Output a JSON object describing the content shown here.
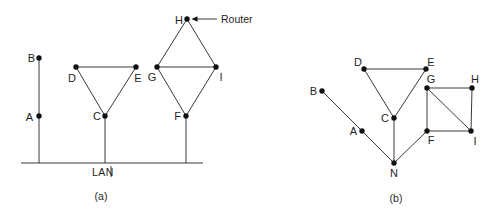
{
  "figure": {
    "width": 499,
    "height": 216,
    "colors": {
      "background": "#ffffff",
      "line": "#3a3a3a",
      "node_fill": "#111111",
      "text": "#1f1f1f"
    },
    "node_radius": 2.7,
    "captions": {
      "a": "(a)",
      "b": "(b)"
    },
    "labels": {
      "lan": "LAN",
      "router": "Router"
    },
    "diagram_a": {
      "nodes": [
        {
          "id": "B",
          "x": 39,
          "y": 58,
          "label": "B",
          "lx": 35,
          "ly": 62,
          "anchor": "end"
        },
        {
          "id": "A",
          "x": 39,
          "y": 116,
          "label": "A",
          "lx": 33,
          "ly": 121,
          "anchor": "end"
        },
        {
          "id": "D",
          "x": 76,
          "y": 67,
          "label": "D",
          "lx": 72,
          "ly": 82,
          "anchor": "middle"
        },
        {
          "id": "E",
          "x": 136,
          "y": 67,
          "label": "E",
          "lx": 138,
          "ly": 82,
          "anchor": "middle"
        },
        {
          "id": "C",
          "x": 105,
          "y": 116,
          "label": "C",
          "lx": 101,
          "ly": 120,
          "anchor": "end"
        },
        {
          "id": "H",
          "x": 187,
          "y": 19,
          "label": "H",
          "lx": 183,
          "ly": 24,
          "anchor": "end"
        },
        {
          "id": "G",
          "x": 157,
          "y": 67,
          "label": "G",
          "lx": 152,
          "ly": 81,
          "anchor": "middle"
        },
        {
          "id": "I",
          "x": 216,
          "y": 67,
          "label": "I",
          "lx": 221,
          "ly": 81,
          "anchor": "middle"
        },
        {
          "id": "F",
          "x": 186,
          "y": 116,
          "label": "F",
          "lx": 181,
          "ly": 120,
          "anchor": "end"
        }
      ],
      "edges": [
        [
          "D",
          "E"
        ],
        [
          "D",
          "C"
        ],
        [
          "E",
          "C"
        ],
        [
          "H",
          "G"
        ],
        [
          "H",
          "I"
        ],
        [
          "G",
          "I"
        ],
        [
          "G",
          "F"
        ],
        [
          "I",
          "F"
        ]
      ],
      "bus": {
        "x1": 21,
        "y1": 163,
        "x2": 203,
        "y2": 163
      },
      "drops": [
        {
          "x": 39,
          "y1": 58,
          "y2": 163
        },
        {
          "x": 105,
          "y1": 116,
          "y2": 163
        },
        {
          "x": 186,
          "y1": 116,
          "y2": 163
        }
      ],
      "lan_label_tick": {
        "x": 111,
        "y1": 166,
        "y2": 177
      },
      "router_arrow": {
        "line": {
          "x1": 217,
          "y1": 19,
          "x2": 197,
          "y2": 19
        },
        "head": {
          "tip_x": 191.5,
          "tip_y": 19,
          "back_x": 197.5,
          "half_h": 2.7
        }
      }
    },
    "diagram_b": {
      "nodes": [
        {
          "id": "B",
          "x": 322,
          "y": 91,
          "label": "B",
          "lx": 317,
          "ly": 95,
          "anchor": "end"
        },
        {
          "id": "A",
          "x": 362,
          "y": 131,
          "label": "A",
          "lx": 357,
          "ly": 135,
          "anchor": "end"
        },
        {
          "id": "N",
          "x": 394,
          "y": 163,
          "label": "N",
          "lx": 394,
          "ly": 177,
          "anchor": "middle"
        },
        {
          "id": "C",
          "x": 394,
          "y": 118,
          "label": "C",
          "lx": 389,
          "ly": 122,
          "anchor": "end"
        },
        {
          "id": "D",
          "x": 364,
          "y": 69,
          "label": "D",
          "lx": 358,
          "ly": 66,
          "anchor": "middle"
        },
        {
          "id": "E",
          "x": 426,
          "y": 69,
          "label": "E",
          "lx": 431,
          "ly": 66,
          "anchor": "middle"
        },
        {
          "id": "G",
          "x": 427,
          "y": 88,
          "label": "G",
          "lx": 431,
          "ly": 83,
          "anchor": "middle"
        },
        {
          "id": "H",
          "x": 472,
          "y": 88,
          "label": "H",
          "lx": 475,
          "ly": 83,
          "anchor": "middle"
        },
        {
          "id": "F",
          "x": 427,
          "y": 131,
          "label": "F",
          "lx": 431,
          "ly": 144,
          "anchor": "middle"
        },
        {
          "id": "I",
          "x": 471,
          "y": 131,
          "label": "I",
          "lx": 475,
          "ly": 145,
          "anchor": "middle"
        }
      ],
      "edges": [
        [
          "B",
          "A"
        ],
        [
          "A",
          "N"
        ],
        [
          "C",
          "N"
        ],
        [
          "D",
          "E"
        ],
        [
          "D",
          "C"
        ],
        [
          "E",
          "C"
        ],
        [
          "G",
          "H"
        ],
        [
          "H",
          "I"
        ],
        [
          "G",
          "F"
        ],
        [
          "F",
          "I"
        ],
        [
          "G",
          "I"
        ],
        [
          "F",
          "N"
        ]
      ]
    }
  }
}
